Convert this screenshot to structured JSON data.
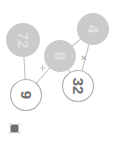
{
  "diagram": {
    "kind": "expression-tree",
    "orientation_degrees": 90,
    "colors": {
      "filled_node_fill": "#cccccc",
      "filled_node_text": "#e0e0e0",
      "open_node_fill": "#ffffff",
      "open_node_stroke": "#b0b0b0",
      "open_node_text": "#6f6f6f",
      "edge": "#bdbdbd",
      "operator_text": "#9a9a9a",
      "background": "#ffffff",
      "badge": "#6f6f6f"
    },
    "nodes": [
      {
        "id": "n4",
        "label": "4",
        "style": "filled",
        "x": 29,
        "y": 26
      },
      {
        "id": "n32",
        "label": "32",
        "style": "open",
        "x": 86,
        "y": 41
      },
      {
        "id": "n8",
        "label": "8",
        "style": "filled",
        "x": 56,
        "y": 59
      },
      {
        "id": "n9",
        "label": "9",
        "style": "open",
        "x": 95,
        "y": 93
      },
      {
        "id": "n72",
        "label": "72",
        "style": "filled",
        "x": 40,
        "y": 96
      }
    ],
    "operators": [
      {
        "id": "op-multiply",
        "label": "×",
        "name": "multiplication-operator",
        "x": 58,
        "y": 35
      },
      {
        "id": "op-divide",
        "label": "÷",
        "name": "division-operator",
        "x": 68,
        "y": 76
      }
    ],
    "edges": [
      {
        "from": "n4",
        "to": "n32"
      },
      {
        "from": "n8",
        "to": "n32"
      },
      {
        "from": "n4",
        "to": "n8"
      },
      {
        "from": "n8",
        "to": "n9"
      },
      {
        "from": "n72",
        "to": "n9"
      }
    ]
  },
  "badge": {
    "name": "corner-badge",
    "label": ""
  }
}
